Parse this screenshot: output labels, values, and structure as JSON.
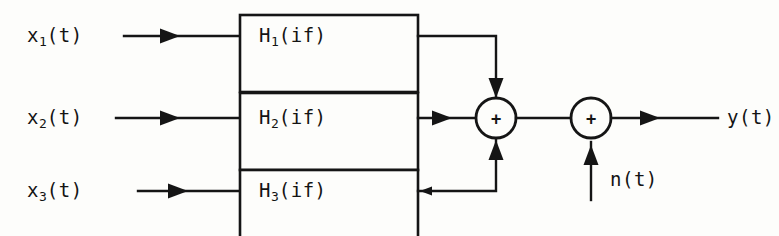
{
  "figure": {
    "name": "parallel-filter-bank-block-diagram",
    "background_color": "#fdfdfb",
    "line_color": "#151515"
  },
  "inputs": [
    {
      "label_main": "x",
      "label_sub": "1",
      "label_tail": "(t)",
      "text": "x1(t)",
      "row": "top"
    },
    {
      "label_main": "x",
      "label_sub": "2",
      "label_tail": "(t)",
      "text": "x2(t)",
      "row": "middle"
    },
    {
      "label_main": "x",
      "label_sub": "3",
      "label_tail": "(t)",
      "text": "x3(t)",
      "row": "bottom"
    }
  ],
  "blocks": [
    {
      "label_main": "H",
      "label_sub": "1",
      "label_tail": "(if)",
      "text": "H1(if)",
      "row": "top"
    },
    {
      "label_main": "H",
      "label_sub": "2",
      "label_tail": "(if)",
      "text": "H2(if)",
      "row": "middle"
    },
    {
      "label_main": "H",
      "label_sub": "3",
      "label_tail": "(if)",
      "text": "H3(if)",
      "row": "bottom"
    }
  ],
  "adders": [
    {
      "symbol": "+",
      "name": "summing-junction-signals"
    },
    {
      "symbol": "+",
      "name": "summing-junction-noise"
    }
  ],
  "noise": {
    "text": "n(t)"
  },
  "output": {
    "text": "y(t)"
  }
}
